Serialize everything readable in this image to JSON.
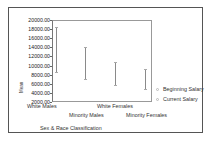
{
  "chart_data": {
    "type": "range",
    "title": "",
    "xlabel": "Sex & Race Classification",
    "ylabel": "Mean",
    "categories": [
      "White Males",
      "Minority Males",
      "White Females",
      "Minority Females"
    ],
    "series": [
      {
        "name": "Beginning Salary",
        "values": [
          8500,
          7000,
          5800,
          4800
        ]
      },
      {
        "name": "Current Salary",
        "values": [
          18500,
          14000,
          10800,
          9300
        ]
      }
    ],
    "y_ticks": [
      "20000.00",
      "18000.00",
      "16000.00",
      "14000.00",
      "12000.00",
      "10000.00",
      "8000.00",
      "6000.00",
      "4000.00",
      "2000.00"
    ],
    "ylim": [
      2000,
      20000
    ],
    "grid": false,
    "legend_position": "right"
  },
  "legend": {
    "items": [
      {
        "label": "Beginning Salary"
      },
      {
        "label": "Current Salary"
      }
    ]
  },
  "colors": {
    "line": "#8a8a8a",
    "frame": "#555555",
    "background": "#ffffff"
  }
}
